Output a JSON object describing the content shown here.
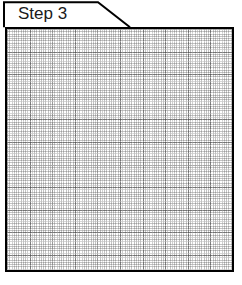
{
  "panel": {
    "tab": {
      "label": "Step 3",
      "shape": "folder-tab-clipped-corner"
    },
    "body": {
      "content_type": "graph-paper-grid",
      "grid": {
        "minor_spacing_px": 2.26,
        "major_spacing_px": 22.6,
        "minor_color": "#696969",
        "major_color": "#464646",
        "background_color": "#ffffff",
        "border_color": "#000000"
      }
    }
  }
}
